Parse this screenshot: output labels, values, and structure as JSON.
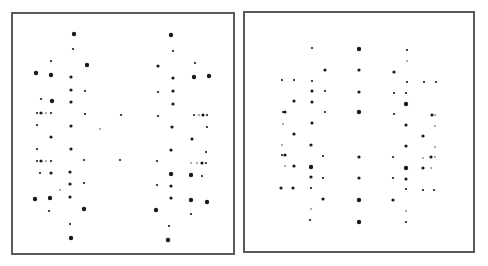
{
  "figure": {
    "spot_color": "#1a1a1a",
    "border_color": "#5a5a5a",
    "size_radius": {
      "tiny": 0.7,
      "small": 1.1,
      "med": 1.6,
      "big": 2.2
    },
    "panels": [
      {
        "id": "left",
        "box": {
          "x": 11,
          "y": 12,
          "w": 224,
          "h": 243
        },
        "spots": [
          [
            74,
            34,
            "big"
          ],
          [
            73,
            49,
            "small"
          ],
          [
            51,
            61,
            "small"
          ],
          [
            87,
            65,
            "big"
          ],
          [
            36,
            73,
            "big"
          ],
          [
            51,
            75,
            "big"
          ],
          [
            71,
            77,
            "med"
          ],
          [
            71,
            90,
            "med"
          ],
          [
            85,
            91,
            "small"
          ],
          [
            41,
            99,
            "small"
          ],
          [
            52,
            101,
            "big"
          ],
          [
            71,
            102,
            "med"
          ],
          [
            37,
            113,
            "small"
          ],
          [
            41,
            113,
            "med"
          ],
          [
            46,
            113,
            "tiny"
          ],
          [
            51,
            113,
            "small"
          ],
          [
            85,
            114,
            "small"
          ],
          [
            121,
            115,
            "small"
          ],
          [
            37,
            125,
            "small"
          ],
          [
            71,
            126,
            "med"
          ],
          [
            100,
            129,
            "tiny"
          ],
          [
            51,
            137,
            "med"
          ],
          [
            37,
            149,
            "small"
          ],
          [
            71,
            149,
            "med"
          ],
          [
            37,
            161,
            "small"
          ],
          [
            41,
            161,
            "med"
          ],
          [
            46,
            161,
            "tiny"
          ],
          [
            51,
            161,
            "small"
          ],
          [
            84,
            160,
            "small"
          ],
          [
            120,
            160,
            "small"
          ],
          [
            40,
            173,
            "small"
          ],
          [
            51,
            173,
            "med"
          ],
          [
            70,
            172,
            "med"
          ],
          [
            70,
            184,
            "med"
          ],
          [
            84,
            183,
            "small"
          ],
          [
            60,
            190,
            "tiny"
          ],
          [
            35,
            199,
            "big"
          ],
          [
            50,
            198,
            "big"
          ],
          [
            70,
            197,
            "med"
          ],
          [
            84,
            209,
            "big"
          ],
          [
            49,
            211,
            "small"
          ],
          [
            70,
            224,
            "small"
          ],
          [
            71,
            238,
            "big"
          ],
          [
            171,
            35,
            "big"
          ],
          [
            173,
            51,
            "small"
          ],
          [
            158,
            66,
            "med"
          ],
          [
            195,
            63,
            "small"
          ],
          [
            194,
            77,
            "big"
          ],
          [
            209,
            76,
            "big"
          ],
          [
            173,
            78,
            "med"
          ],
          [
            158,
            92,
            "small"
          ],
          [
            173,
            91,
            "med"
          ],
          [
            173,
            104,
            "med"
          ],
          [
            158,
            116,
            "small"
          ],
          [
            194,
            115,
            "small"
          ],
          [
            199,
            115,
            "tiny"
          ],
          [
            203,
            115,
            "med"
          ],
          [
            207,
            115,
            "small"
          ],
          [
            172,
            127,
            "med"
          ],
          [
            207,
            127,
            "small"
          ],
          [
            192,
            139,
            "med"
          ],
          [
            171,
            150,
            "med"
          ],
          [
            206,
            152,
            "small"
          ],
          [
            157,
            161,
            "small"
          ],
          [
            191,
            163,
            "tiny"
          ],
          [
            197,
            163,
            "tiny"
          ],
          [
            202,
            163,
            "med"
          ],
          [
            206,
            163,
            "small"
          ],
          [
            171,
            174,
            "big"
          ],
          [
            191,
            175,
            "big"
          ],
          [
            202,
            176,
            "small"
          ],
          [
            157,
            185,
            "small"
          ],
          [
            171,
            186,
            "med"
          ],
          [
            171,
            198,
            "med"
          ],
          [
            191,
            200,
            "big"
          ],
          [
            207,
            202,
            "big"
          ],
          [
            156,
            210,
            "big"
          ],
          [
            191,
            214,
            "small"
          ],
          [
            169,
            226,
            "small"
          ],
          [
            168,
            240,
            "big"
          ]
        ]
      },
      {
        "id": "right",
        "box": {
          "x": 243,
          "y": 11,
          "w": 232,
          "h": 242
        },
        "spots": [
          [
            312,
            48,
            "small"
          ],
          [
            359,
            49,
            "big"
          ],
          [
            407,
            50,
            "small"
          ],
          [
            407,
            61,
            "tiny"
          ],
          [
            325,
            70,
            "med"
          ],
          [
            359,
            70,
            "med"
          ],
          [
            394,
            72,
            "med"
          ],
          [
            282,
            80,
            "small"
          ],
          [
            294,
            80,
            "small"
          ],
          [
            312,
            81,
            "small"
          ],
          [
            407,
            82,
            "small"
          ],
          [
            424,
            82,
            "small"
          ],
          [
            436,
            82,
            "small"
          ],
          [
            312,
            91,
            "med"
          ],
          [
            325,
            91,
            "small"
          ],
          [
            359,
            92,
            "med"
          ],
          [
            394,
            93,
            "small"
          ],
          [
            406,
            93,
            "small"
          ],
          [
            294,
            101,
            "med"
          ],
          [
            312,
            102,
            "med"
          ],
          [
            406,
            104,
            "big"
          ],
          [
            283,
            112,
            "small"
          ],
          [
            285,
            112,
            "med"
          ],
          [
            325,
            112,
            "small"
          ],
          [
            359,
            112,
            "big"
          ],
          [
            394,
            114,
            "small"
          ],
          [
            432,
            115,
            "med"
          ],
          [
            435,
            115,
            "tiny"
          ],
          [
            283,
            124,
            "tiny"
          ],
          [
            312,
            123,
            "med"
          ],
          [
            406,
            125,
            "med"
          ],
          [
            435,
            126,
            "tiny"
          ],
          [
            294,
            134,
            "med"
          ],
          [
            423,
            136,
            "med"
          ],
          [
            282,
            145,
            "tiny"
          ],
          [
            311,
            145,
            "med"
          ],
          [
            406,
            146,
            "med"
          ],
          [
            435,
            147,
            "tiny"
          ],
          [
            282,
            155,
            "small"
          ],
          [
            285,
            155,
            "med"
          ],
          [
            323,
            156,
            "small"
          ],
          [
            359,
            157,
            "med"
          ],
          [
            393,
            157,
            "small"
          ],
          [
            423,
            158,
            "tiny"
          ],
          [
            431,
            157,
            "med"
          ],
          [
            435,
            157,
            "tiny"
          ],
          [
            285,
            166,
            "tiny"
          ],
          [
            294,
            166,
            "med"
          ],
          [
            311,
            167,
            "big"
          ],
          [
            406,
            168,
            "big"
          ],
          [
            423,
            168,
            "med"
          ],
          [
            431,
            168,
            "tiny"
          ],
          [
            311,
            177,
            "med"
          ],
          [
            323,
            178,
            "small"
          ],
          [
            359,
            178,
            "med"
          ],
          [
            393,
            178,
            "small"
          ],
          [
            406,
            179,
            "med"
          ],
          [
            281,
            188,
            "med"
          ],
          [
            293,
            188,
            "med"
          ],
          [
            311,
            188,
            "small"
          ],
          [
            406,
            189,
            "small"
          ],
          [
            423,
            190,
            "small"
          ],
          [
            434,
            190,
            "small"
          ],
          [
            323,
            199,
            "med"
          ],
          [
            359,
            200,
            "big"
          ],
          [
            393,
            200,
            "med"
          ],
          [
            311,
            209,
            "tiny"
          ],
          [
            406,
            211,
            "tiny"
          ],
          [
            310,
            220,
            "small"
          ],
          [
            359,
            222,
            "big"
          ],
          [
            406,
            222,
            "small"
          ]
        ]
      }
    ]
  }
}
